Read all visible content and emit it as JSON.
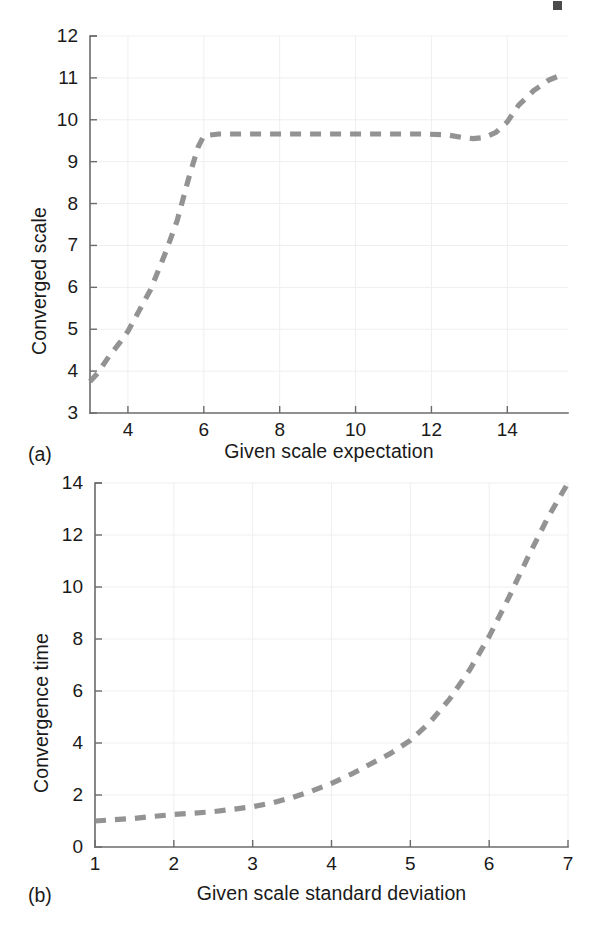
{
  "figure": {
    "background_color": "#ffffff",
    "curve_color": "#8a8a8a",
    "axis_color": "#6b6b6b",
    "grid_color": "#efefef",
    "text_color": "#1a1a1a"
  },
  "panels": [
    {
      "tag": "(a)",
      "tag_name": "panel-tag-a"
    },
    {
      "tag": "(b)",
      "tag_name": "panel-tag-b"
    }
  ],
  "chart_data": [
    {
      "type": "line",
      "panel": "(a)",
      "title": "",
      "xlabel": "Given scale expectation",
      "ylabel": "Converged scale",
      "xlim": [
        3,
        15.6
      ],
      "ylim": [
        3,
        12
      ],
      "xticks": [
        4,
        6,
        8,
        10,
        12,
        14
      ],
      "yticks": [
        3,
        4,
        5,
        6,
        7,
        8,
        9,
        10,
        11,
        12
      ],
      "xtick_labels": [
        "4",
        "6",
        "8",
        "10",
        "12",
        "14"
      ],
      "ytick_labels": [
        "3",
        "4",
        "5",
        "6",
        "7",
        "8",
        "9",
        "10",
        "11",
        "12"
      ],
      "grid": true,
      "linestyle": "dashed",
      "legend": null,
      "x": [
        3.0,
        3.2,
        3.5,
        3.8,
        4.0,
        4.3,
        4.6,
        5.0,
        5.3,
        5.6,
        5.85,
        6.0,
        6.4,
        7.0,
        7.6,
        8.2,
        8.8,
        9.4,
        10.0,
        10.6,
        11.2,
        11.8,
        12.4,
        12.8,
        13.1,
        13.4,
        13.7,
        14.0,
        14.3,
        14.7,
        15.1,
        15.5
      ],
      "y": [
        3.75,
        3.95,
        4.35,
        4.7,
        4.95,
        5.45,
        5.95,
        6.85,
        7.6,
        8.6,
        9.35,
        9.62,
        9.66,
        9.66,
        9.66,
        9.66,
        9.66,
        9.66,
        9.66,
        9.66,
        9.66,
        9.66,
        9.64,
        9.58,
        9.55,
        9.58,
        9.7,
        9.95,
        10.35,
        10.7,
        10.95,
        11.1
      ]
    },
    {
      "type": "line",
      "panel": "(b)",
      "title": "",
      "xlabel": "Given scale standard deviation",
      "ylabel": "Convergence time",
      "xlim": [
        1,
        7
      ],
      "ylim": [
        0,
        14
      ],
      "xticks": [
        1,
        2,
        3,
        4,
        5,
        6,
        7
      ],
      "yticks": [
        0,
        2,
        4,
        6,
        8,
        10,
        12,
        14
      ],
      "xtick_labels": [
        "1",
        "2",
        "3",
        "4",
        "5",
        "6",
        "7"
      ],
      "ytick_labels": [
        "0",
        "2",
        "4",
        "6",
        "8",
        "10",
        "12",
        "14"
      ],
      "grid": true,
      "linestyle": "dashed",
      "legend": null,
      "x": [
        1.0,
        1.25,
        1.5,
        1.75,
        2.0,
        2.25,
        2.5,
        2.75,
        3.0,
        3.25,
        3.5,
        3.75,
        4.0,
        4.25,
        4.5,
        4.75,
        5.0,
        5.25,
        5.5,
        5.75,
        6.0,
        6.25,
        6.5,
        6.75,
        7.0
      ],
      "y": [
        1.0,
        1.05,
        1.1,
        1.18,
        1.25,
        1.3,
        1.36,
        1.45,
        1.55,
        1.7,
        1.9,
        2.15,
        2.45,
        2.8,
        3.2,
        3.6,
        4.1,
        4.8,
        5.7,
        6.8,
        8.1,
        9.6,
        11.2,
        12.7,
        14.0
      ]
    }
  ]
}
